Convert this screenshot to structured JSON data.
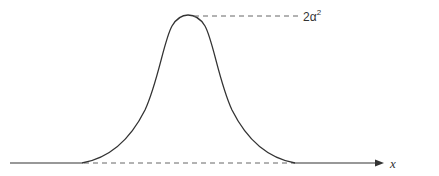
{
  "diagram": {
    "type": "bell-curve",
    "peak_label": {
      "base": "2α",
      "sup": "2"
    },
    "axis_label": "x",
    "colors": {
      "curve": "#333333",
      "axis": "#333333",
      "dashed": "#555555",
      "background": "#ffffff"
    }
  }
}
